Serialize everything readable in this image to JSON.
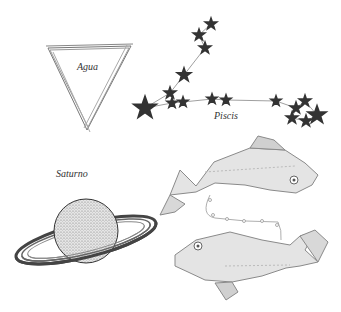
{
  "illustration": {
    "description": "Engraved astrological illustration with water triangle, Pisces constellation, Saturn and two fish",
    "labels": {
      "water": "Agua",
      "constellation": "Piscis",
      "planet": "Saturno"
    },
    "colors": {
      "ink": "#555555",
      "fish_ink": "#8a8a8a",
      "background": "#ffffff"
    }
  }
}
